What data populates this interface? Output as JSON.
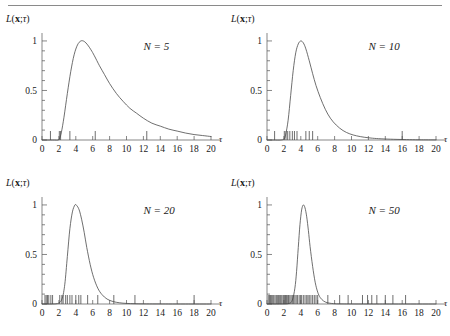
{
  "figure": {
    "yaxis_label_parts": {
      "L": "L",
      "paren_open": "(",
      "x": "x",
      "semi": ";",
      "tau": "τ",
      "paren_close": ")"
    },
    "tau_symbol": "τ"
  },
  "chart_data": [
    {
      "type": "line",
      "panel_id": "panel-n5",
      "title": "",
      "annotation": "N = 5",
      "annotation_parts": {
        "symbol": "N",
        "equals": "=",
        "value": "5"
      },
      "xlabel": "τ",
      "ylabel": "L(x;τ)",
      "xlim": [
        0,
        20
      ],
      "ylim": [
        0,
        1.05
      ],
      "xticks": [
        0,
        2,
        4,
        6,
        8,
        10,
        12,
        14,
        16,
        18,
        20
      ],
      "xticklabels": [
        "0",
        "2",
        "4",
        "6",
        "8",
        "10",
        "12",
        "14",
        "16",
        "18",
        "20"
      ],
      "yticks": [
        0,
        0.5,
        1
      ],
      "yticklabels": [
        "0",
        "0.5",
        "1"
      ],
      "yminorticks": [
        0.1,
        0.2,
        0.3,
        0.4,
        0.6,
        0.7,
        0.8,
        0.9
      ],
      "grid": false,
      "legend": "none",
      "series": [
        {
          "name": "likelihood",
          "x": [
            0,
            0.5,
            1,
            1.5,
            1.9,
            2.1,
            2.3,
            2.6,
            3,
            3.4,
            3.8,
            4.2,
            4.6,
            5,
            5.4,
            5.8,
            6.2,
            6.8,
            7.4,
            8,
            8.8,
            9.6,
            10.4,
            11.2,
            12,
            13,
            14,
            15,
            16,
            17,
            18,
            19,
            20
          ],
          "y": [
            0,
            0,
            0,
            0,
            0,
            0.02,
            0.08,
            0.23,
            0.47,
            0.69,
            0.86,
            0.96,
            1.0,
            0.995,
            0.96,
            0.91,
            0.85,
            0.75,
            0.66,
            0.57,
            0.47,
            0.39,
            0.32,
            0.27,
            0.22,
            0.17,
            0.14,
            0.11,
            0.09,
            0.07,
            0.055,
            0.045,
            0.035
          ]
        }
      ],
      "rug": [
        1.0,
        2.05,
        2.2,
        3.3,
        6.3,
        12.4
      ]
    },
    {
      "type": "line",
      "panel_id": "panel-n10",
      "title": "",
      "annotation": "N = 10",
      "annotation_parts": {
        "symbol": "N",
        "equals": "=",
        "value": "10"
      },
      "xlabel": "τ",
      "ylabel": "L(x;τ)",
      "xlim": [
        0,
        20
      ],
      "ylim": [
        0,
        1.05
      ],
      "xticks": [
        0,
        2,
        4,
        6,
        8,
        10,
        12,
        14,
        16,
        18,
        20
      ],
      "xticklabels": [
        "0",
        "2",
        "4",
        "6",
        "8",
        "10",
        "12",
        "14",
        "16",
        "18",
        "20"
      ],
      "yticks": [
        0,
        0.5,
        1
      ],
      "yticklabels": [
        "0",
        "0.5",
        "1"
      ],
      "yminorticks": [
        0.1,
        0.2,
        0.3,
        0.4,
        0.6,
        0.7,
        0.8,
        0.9
      ],
      "grid": false,
      "legend": "none",
      "series": [
        {
          "name": "likelihood",
          "x": [
            0,
            0.8,
            1.6,
            2.0,
            2.2,
            2.5,
            2.8,
            3.1,
            3.4,
            3.7,
            4.0,
            4.3,
            4.6,
            5.0,
            5.4,
            5.8,
            6.3,
            6.9,
            7.5,
            8.2,
            9.0,
            9.8,
            10.6,
            11.5,
            12.5,
            13.5,
            15,
            16.5,
            18,
            20
          ],
          "y": [
            0,
            0,
            0,
            0.01,
            0.05,
            0.2,
            0.45,
            0.7,
            0.88,
            0.97,
            1.0,
            0.98,
            0.92,
            0.8,
            0.67,
            0.55,
            0.43,
            0.31,
            0.22,
            0.15,
            0.095,
            0.062,
            0.042,
            0.028,
            0.018,
            0.012,
            0.007,
            0.004,
            0.002,
            0.001
          ]
        }
      ],
      "rug": [
        0.9,
        2.05,
        2.25,
        2.45,
        2.7,
        3.0,
        3.25,
        3.55,
        4.6,
        5.0,
        5.4,
        16.0
      ]
    },
    {
      "type": "line",
      "panel_id": "panel-n20",
      "title": "",
      "annotation": "N = 20",
      "annotation_parts": {
        "symbol": "N",
        "equals": "=",
        "value": "20"
      },
      "xlabel": "τ",
      "ylabel": "L(x;τ)",
      "xlim": [
        0,
        20
      ],
      "ylim": [
        0,
        1.05
      ],
      "xticks": [
        0,
        2,
        4,
        6,
        8,
        10,
        12,
        14,
        16,
        18,
        20
      ],
      "xticklabels": [
        "0",
        "2",
        "4",
        "6",
        "8",
        "10",
        "12",
        "14",
        "16",
        "18",
        "20"
      ],
      "yticks": [
        0,
        0.5,
        1
      ],
      "yticklabels": [
        "0",
        "0.5",
        "1"
      ],
      "yminorticks": [
        0.1,
        0.2,
        0.3,
        0.4,
        0.6,
        0.7,
        0.8,
        0.9
      ],
      "grid": false,
      "legend": "none",
      "series": [
        {
          "name": "likelihood",
          "x": [
            0,
            1.2,
            2.0,
            2.4,
            2.7,
            3.0,
            3.3,
            3.6,
            3.9,
            4.1,
            4.4,
            4.7,
            5.0,
            5.3,
            5.7,
            6.1,
            6.6,
            7.1,
            7.7,
            8.4,
            9.2,
            10.0,
            11.0,
            12.0,
            13.5,
            15,
            17,
            20
          ],
          "y": [
            0,
            0,
            0.01,
            0.06,
            0.2,
            0.48,
            0.76,
            0.93,
            1.0,
            0.995,
            0.95,
            0.85,
            0.72,
            0.57,
            0.4,
            0.27,
            0.16,
            0.095,
            0.05,
            0.025,
            0.012,
            0.006,
            0.003,
            0.0015,
            0.0008,
            0.0004,
            0.0002,
            0
          ]
        }
      ],
      "rug": [
        0.35,
        0.5,
        0.65,
        0.8,
        1.05,
        1.25,
        2.1,
        2.35,
        2.5,
        2.8,
        3.0,
        3.3,
        3.55,
        4.0,
        4.35,
        4.6,
        5.4,
        6.6,
        8.5,
        11.0,
        18.0
      ]
    },
    {
      "type": "line",
      "panel_id": "panel-n50",
      "title": "",
      "annotation": "N = 50",
      "annotation_parts": {
        "symbol": "N",
        "equals": "=",
        "value": "50"
      },
      "xlabel": "τ",
      "ylabel": "L(x;τ)",
      "xlim": [
        0,
        20
      ],
      "ylim": [
        0,
        1.05
      ],
      "xticks": [
        0,
        2,
        4,
        6,
        8,
        10,
        12,
        14,
        16,
        18,
        20
      ],
      "xticklabels": [
        "0",
        "2",
        "4",
        "6",
        "8",
        "10",
        "12",
        "14",
        "16",
        "18",
        "20"
      ],
      "yticks": [
        0,
        0.5,
        1
      ],
      "yticklabels": [
        "0",
        "0.5",
        "1"
      ],
      "yminorticks": [
        0.1,
        0.2,
        0.3,
        0.4,
        0.6,
        0.7,
        0.8,
        0.9
      ],
      "grid": false,
      "legend": "none",
      "series": [
        {
          "name": "likelihood",
          "x": [
            0,
            1.5,
            2.6,
            3.0,
            3.3,
            3.5,
            3.7,
            3.9,
            4.1,
            4.3,
            4.5,
            4.7,
            4.9,
            5.1,
            5.4,
            5.7,
            6.0,
            6.3,
            6.7,
            7.1,
            7.6,
            8.2,
            9.0,
            10.0,
            12.0,
            15.0,
            20.0
          ],
          "y": [
            0,
            0,
            0.005,
            0.04,
            0.16,
            0.33,
            0.57,
            0.8,
            0.95,
            1.0,
            0.97,
            0.88,
            0.74,
            0.58,
            0.38,
            0.22,
            0.12,
            0.065,
            0.03,
            0.014,
            0.006,
            0.002,
            0.001,
            0.0005,
            0.0002,
            0.0001,
            0
          ]
        }
      ],
      "rug": [
        0.15,
        0.3,
        0.42,
        0.55,
        0.68,
        0.8,
        0.95,
        1.1,
        1.22,
        1.35,
        1.5,
        1.62,
        1.75,
        1.9,
        2.0,
        2.1,
        2.2,
        2.3,
        2.45,
        2.55,
        2.7,
        2.85,
        3.0,
        3.15,
        3.3,
        3.45,
        3.6,
        3.8,
        3.95,
        4.1,
        4.3,
        4.5,
        4.7,
        4.85,
        5.0,
        5.2,
        5.4,
        5.6,
        5.8,
        6.0,
        7.2,
        8.6,
        9.6,
        11.3,
        11.9,
        12.4,
        13.0,
        14.0,
        14.9,
        16.4
      ]
    }
  ]
}
